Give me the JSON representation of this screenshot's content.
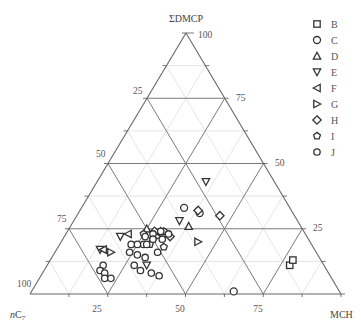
{
  "chart_data": {
    "type": "ternary-scatter",
    "title": "",
    "axes": {
      "top": "ΣDMCP",
      "left": "nC7",
      "right": "MCH"
    },
    "tick_values": [
      25,
      50,
      75,
      100
    ],
    "grid": true,
    "legend_position": "right",
    "series": [
      {
        "name": "B",
        "marker": "square",
        "points": [
          {
            "nC7": 11,
            "MCH": 78,
            "DMCP": 11
          },
          {
            "nC7": 9,
            "MCH": 78,
            "DMCP": 13
          }
        ]
      },
      {
        "name": "C",
        "marker": "circle",
        "points": [
          {
            "nC7": 34,
            "MCH": 33,
            "DMCP": 33
          },
          {
            "nC7": 30,
            "MCH": 39,
            "DMCP": 31
          },
          {
            "nC7": 34,
            "MCH": 65,
            "DMCP": 1
          }
        ]
      },
      {
        "name": "D",
        "marker": "triangle-up",
        "points": [
          {
            "nC7": 46,
            "MCH": 30,
            "DMCP": 24
          },
          {
            "nC7": 36,
            "MCH": 38,
            "DMCP": 26
          },
          {
            "nC7": 50,
            "MCH": 25,
            "DMCP": 25
          }
        ]
      },
      {
        "name": "E",
        "marker": "triangle-down",
        "points": [
          {
            "nC7": 22,
            "MCH": 35,
            "DMCP": 43
          },
          {
            "nC7": 38,
            "MCH": 34,
            "DMCP": 28
          },
          {
            "nC7": 60,
            "MCH": 18,
            "DMCP": 22
          },
          {
            "nC7": 69,
            "MCH": 14,
            "DMCP": 17
          },
          {
            "nC7": 57,
            "MCH": 32,
            "DMCP": 11
          }
        ]
      },
      {
        "name": "F",
        "marker": "triangle-left",
        "points": [
          {
            "nC7": 57,
            "MCH": 20,
            "DMCP": 23
          },
          {
            "nC7": 68,
            "MCH": 15,
            "DMCP": 17
          }
        ]
      },
      {
        "name": "G",
        "marker": "triangle-right",
        "points": [
          {
            "nC7": 36,
            "MCH": 44,
            "DMCP": 20
          },
          {
            "nC7": 66,
            "MCH": 18,
            "DMCP": 16
          },
          {
            "nC7": 48,
            "MCH": 30,
            "DMCP": 22
          }
        ]
      },
      {
        "name": "H",
        "marker": "diamond",
        "points": [
          {
            "nC7": 30,
            "MCH": 38,
            "DMCP": 32
          },
          {
            "nC7": 24,
            "MCH": 46,
            "DMCP": 30
          },
          {
            "nC7": 48,
            "MCH": 28,
            "DMCP": 24
          },
          {
            "nC7": 44,
            "MCH": 34,
            "DMCP": 22
          }
        ]
      },
      {
        "name": "I",
        "marker": "pentagon",
        "points": [
          {
            "nC7": 52,
            "MCH": 25,
            "DMCP": 23
          },
          {
            "nC7": 50,
            "MCH": 29,
            "DMCP": 21
          },
          {
            "nC7": 45,
            "MCH": 31,
            "DMCP": 24
          },
          {
            "nC7": 52,
            "MCH": 29,
            "DMCP": 19
          },
          {
            "nC7": 48,
            "MCH": 34,
            "DMCP": 18
          }
        ]
      },
      {
        "name": "J",
        "marker": "circle-small",
        "points": [
          {
            "nC7": 52,
            "MCH": 26,
            "DMCP": 22
          },
          {
            "nC7": 49,
            "MCH": 28,
            "DMCP": 23
          },
          {
            "nC7": 46,
            "MCH": 30,
            "DMCP": 24
          },
          {
            "nC7": 50,
            "MCH": 29,
            "DMCP": 21
          },
          {
            "nC7": 47,
            "MCH": 32,
            "DMCP": 21
          },
          {
            "nC7": 44,
            "MCH": 33,
            "DMCP": 23
          },
          {
            "nC7": 54,
            "MCH": 27,
            "DMCP": 19
          },
          {
            "nC7": 56,
            "MCH": 25,
            "DMCP": 19
          },
          {
            "nC7": 53,
            "MCH": 28,
            "DMCP": 19
          },
          {
            "nC7": 51,
            "MCH": 33,
            "DMCP": 16
          },
          {
            "nC7": 56,
            "MCH": 30,
            "DMCP": 14
          },
          {
            "nC7": 58,
            "MCH": 27,
            "DMCP": 15
          },
          {
            "nC7": 58,
            "MCH": 23,
            "DMCP": 19
          },
          {
            "nC7": 60,
            "MCH": 24,
            "DMCP": 16
          },
          {
            "nC7": 71,
            "MCH": 18,
            "DMCP": 11
          },
          {
            "nC7": 73,
            "MCH": 18,
            "DMCP": 9
          },
          {
            "nC7": 72,
            "MCH": 20,
            "DMCP": 8
          },
          {
            "nC7": 73,
            "MCH": 21,
            "DMCP": 6
          },
          {
            "nC7": 71,
            "MCH": 23,
            "DMCP": 6
          },
          {
            "nC7": 61,
            "MCH": 28,
            "DMCP": 11
          },
          {
            "nC7": 60,
            "MCH": 31,
            "DMCP": 9
          },
          {
            "nC7": 57,
            "MCH": 35,
            "DMCP": 8
          },
          {
            "nC7": 55,
            "MCH": 38,
            "DMCP": 7
          }
        ]
      }
    ]
  },
  "legend": {
    "items": [
      {
        "label": "B",
        "marker": "square"
      },
      {
        "label": "C",
        "marker": "circle"
      },
      {
        "label": "D",
        "marker": "triangle-up"
      },
      {
        "label": "E",
        "marker": "triangle-down"
      },
      {
        "label": "F",
        "marker": "triangle-left"
      },
      {
        "label": "G",
        "marker": "triangle-right"
      },
      {
        "label": "H",
        "marker": "diamond"
      },
      {
        "label": "I",
        "marker": "pentagon"
      },
      {
        "label": "J",
        "marker": "circle-small"
      }
    ]
  },
  "labels": {
    "top_vertex": "ΣDMCP",
    "left_vertex_prefix": "n",
    "left_vertex_main": "C",
    "left_vertex_sub": "7",
    "right_vertex": "MCH",
    "top_100": "100",
    "left_25": "25",
    "left_50": "50",
    "left_75": "75",
    "left_100": "100",
    "right_75": "75",
    "right_50": "50",
    "right_25": "25",
    "bottom_25": "25",
    "bottom_50": "50",
    "bottom_75": "75"
  },
  "colors": {
    "axis": "#666666",
    "grid_major": "#7a7a7a",
    "grid_minor": "#dddddd",
    "marker": "#333333"
  }
}
